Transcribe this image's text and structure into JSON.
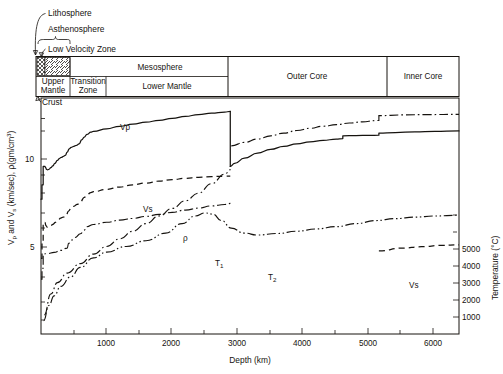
{
  "figure": {
    "title": "",
    "background_color": "#ffffff",
    "ink_color": "#16130f"
  },
  "annotations": {
    "lithosphere": "Lithosphere",
    "asthenosphere": "Asthenosphere",
    "low_velocity_zone": "Low Velocity Zone",
    "crust": "Crust"
  },
  "layer_bar": {
    "upper_row": [
      {
        "label": "Mesosphere",
        "start_km": 700,
        "end_km": 2900
      }
    ],
    "lower_row": [
      {
        "label": "Upper\nMantle",
        "line1": "Upper",
        "line2": "Mantle",
        "start_km": 0,
        "end_km": 400
      },
      {
        "label": "Transition\nZone",
        "line1": "Transition",
        "line2": "Zone",
        "start_km": 400,
        "end_km": 700
      },
      {
        "label": "Lower Mantle",
        "line1": "Lower Mantle",
        "line2": "",
        "start_km": 700,
        "end_km": 2900
      }
    ],
    "full_height": [
      {
        "label": "Outer Core",
        "start_km": 2900,
        "end_km": 5150
      },
      {
        "label": "Inner Core",
        "start_km": 5150,
        "end_km": 6371
      }
    ],
    "hatched_zones": [
      {
        "name": "low-velocity-zone-crosshatch",
        "start_km": 20,
        "end_km": 110,
        "pattern": "crosshatch"
      },
      {
        "name": "asthenosphere-hatch",
        "start_km": 110,
        "end_km": 400,
        "pattern": "diagonal"
      }
    ]
  },
  "axes": {
    "x": {
      "label": "Depth (km)",
      "min": 0,
      "max": 6371,
      "ticks": [
        1000,
        2000,
        3000,
        4000,
        5000,
        6000
      ],
      "tick_labels": [
        "1000",
        "2000",
        "3000",
        "4000",
        "5000",
        "6000"
      ],
      "minor_ticks": [
        500,
        1500,
        2500,
        3500,
        4500,
        5500
      ]
    },
    "y_left": {
      "label": "V_p and V_s (km/sec), ρ (gm/cm³)",
      "label_parts": [
        "V",
        "p",
        " and V",
        "s",
        " (km/sec),  ρ(gm/cm",
        "3",
        ")"
      ],
      "scale": "log",
      "min": 1.5,
      "max": 16,
      "ticks": [
        5,
        10
      ],
      "tick_labels": [
        "5",
        "10"
      ],
      "minor_ticks": [
        2,
        3,
        4,
        6,
        7,
        8,
        9,
        15
      ]
    },
    "y_right": {
      "label": "Temperature (°C)",
      "min": 0,
      "max": 6200,
      "ticks": [
        1000,
        2000,
        3000,
        4000,
        5000
      ],
      "tick_labels": [
        "1000",
        "2000",
        "3000",
        "4000",
        "5000"
      ]
    }
  },
  "chart_data": {
    "type": "line",
    "xlabel": "Depth (km)",
    "ylabel": "Vp and Vs (km/sec), ρ (gm/cm3)",
    "ylabel_right": "Temperature (°C)",
    "xlim": [
      0,
      6371
    ],
    "ylim": [
      1.5,
      16
    ],
    "ylim_right": [
      0,
      6200
    ],
    "yscale": "log",
    "grid": false,
    "legend": "inline-labels",
    "series": [
      {
        "name": "Vp",
        "label": "Vp",
        "axis": "left",
        "style": "solid",
        "units": "km/sec",
        "label_pos": {
          "x_km": 1180,
          "y_val": 11.8
        },
        "points": [
          [
            0,
            5.8
          ],
          [
            15,
            5.8
          ],
          [
            15,
            6.7
          ],
          [
            33,
            6.7
          ],
          [
            33,
            8.05
          ],
          [
            60,
            8.05
          ],
          [
            70,
            7.95
          ],
          [
            85,
            7.82
          ],
          [
            100,
            7.78
          ],
          [
            120,
            7.82
          ],
          [
            150,
            7.95
          ],
          [
            180,
            8.1
          ],
          [
            210,
            8.3
          ],
          [
            250,
            8.55
          ],
          [
            280,
            8.72
          ],
          [
            310,
            8.82
          ],
          [
            340,
            8.9
          ],
          [
            370,
            9.0
          ],
          [
            400,
            9.3
          ],
          [
            430,
            9.6
          ],
          [
            460,
            9.75
          ],
          [
            500,
            9.85
          ],
          [
            540,
            9.95
          ],
          [
            580,
            10.1
          ],
          [
            620,
            10.5
          ],
          [
            660,
            10.8
          ],
          [
            700,
            11.1
          ],
          [
            760,
            11.35
          ],
          [
            800,
            11.45
          ],
          [
            1000,
            11.75
          ],
          [
            1200,
            12.05
          ],
          [
            1400,
            12.3
          ],
          [
            1600,
            12.55
          ],
          [
            1800,
            12.8
          ],
          [
            2000,
            13.05
          ],
          [
            2200,
            13.3
          ],
          [
            2400,
            13.55
          ],
          [
            2600,
            13.75
          ],
          [
            2800,
            13.9
          ],
          [
            2885,
            13.98
          ]
        ]
      },
      {
        "name": "Vp-outer-core",
        "label": "",
        "axis": "left",
        "style": "solid",
        "units": "km/sec",
        "points": [
          [
            2885,
            8.05
          ],
          [
            2950,
            8.3
          ],
          [
            3100,
            8.75
          ],
          [
            3300,
            9.2
          ],
          [
            3500,
            9.55
          ],
          [
            3700,
            9.85
          ],
          [
            3900,
            10.1
          ],
          [
            4100,
            10.3
          ],
          [
            4300,
            10.45
          ],
          [
            4500,
            10.6
          ],
          [
            4600,
            10.65
          ],
          [
            4600,
            10.95
          ],
          [
            4800,
            10.98
          ],
          [
            5000,
            11.0
          ],
          [
            5150,
            11.02
          ],
          [
            5150,
            11.25
          ],
          [
            5400,
            11.32
          ],
          [
            5700,
            11.4
          ],
          [
            6000,
            11.45
          ],
          [
            6371,
            11.5
          ]
        ]
      },
      {
        "name": "Vs",
        "label": "Vs",
        "axis": "left",
        "style": "dashed",
        "units": "km/sec",
        "label_pos": {
          "x_km": 1450,
          "y_val": 5.7
        },
        "points": [
          [
            0,
            3.2
          ],
          [
            15,
            3.2
          ],
          [
            15,
            3.85
          ],
          [
            33,
            3.85
          ],
          [
            33,
            4.6
          ],
          [
            60,
            4.6
          ],
          [
            75,
            4.45
          ],
          [
            95,
            4.38
          ],
          [
            120,
            4.4
          ],
          [
            150,
            4.45
          ],
          [
            180,
            4.5
          ],
          [
            220,
            4.6
          ],
          [
            260,
            4.7
          ],
          [
            300,
            4.8
          ],
          [
            340,
            4.85
          ],
          [
            380,
            4.9
          ],
          [
            420,
            5.15
          ],
          [
            460,
            5.3
          ],
          [
            500,
            5.4
          ],
          [
            550,
            5.5
          ],
          [
            600,
            5.65
          ],
          [
            660,
            5.9
          ],
          [
            700,
            6.05
          ],
          [
            760,
            6.2
          ],
          [
            800,
            6.25
          ],
          [
            1000,
            6.4
          ],
          [
            1200,
            6.55
          ],
          [
            1400,
            6.7
          ],
          [
            1600,
            6.82
          ],
          [
            1800,
            6.95
          ],
          [
            2000,
            7.05
          ],
          [
            2200,
            7.15
          ],
          [
            2400,
            7.22
          ],
          [
            2600,
            7.28
          ],
          [
            2800,
            7.3
          ],
          [
            2885,
            7.3
          ]
        ]
      },
      {
        "name": "Vs-inner-core",
        "label": "Vs",
        "axis": "left",
        "style": "dashed",
        "units": "km/sec",
        "label_pos": {
          "x_km": 5500,
          "y_val": 3.75
        },
        "points": [
          [
            5150,
            3.45
          ],
          [
            5500,
            3.55
          ],
          [
            5800,
            3.6
          ],
          [
            6100,
            3.65
          ],
          [
            6371,
            3.67
          ]
        ]
      },
      {
        "name": "rho",
        "label": "ρ",
        "axis": "left",
        "style": "dash-dot",
        "units": "gm/cm3",
        "label_pos": {
          "x_km": 1850,
          "y_val": 5.45
        },
        "points": [
          [
            0,
            2.6
          ],
          [
            15,
            2.6
          ],
          [
            15,
            2.9
          ],
          [
            33,
            2.9
          ],
          [
            33,
            3.35
          ],
          [
            100,
            3.36
          ],
          [
            200,
            3.4
          ],
          [
            300,
            3.47
          ],
          [
            400,
            3.55
          ],
          [
            420,
            3.72
          ],
          [
            470,
            3.85
          ],
          [
            520,
            3.95
          ],
          [
            600,
            4.1
          ],
          [
            660,
            4.25
          ],
          [
            700,
            4.4
          ],
          [
            800,
            4.5
          ],
          [
            1000,
            4.6
          ],
          [
            1200,
            4.7
          ],
          [
            1400,
            4.78
          ],
          [
            1600,
            4.88
          ],
          [
            1800,
            4.98
          ],
          [
            2000,
            5.08
          ],
          [
            2200,
            5.2
          ],
          [
            2400,
            5.3
          ],
          [
            2600,
            5.42
          ],
          [
            2800,
            5.5
          ],
          [
            2900,
            5.56
          ]
        ]
      },
      {
        "name": "rho-core",
        "label": "",
        "axis": "left",
        "style": "dash-dot",
        "units": "gm/cm3",
        "points": [
          [
            2900,
            9.9
          ],
          [
            3100,
            10.25
          ],
          [
            3300,
            10.6
          ],
          [
            3500,
            10.95
          ],
          [
            3700,
            11.25
          ],
          [
            3900,
            11.55
          ],
          [
            4100,
            11.8
          ],
          [
            4300,
            12.05
          ],
          [
            4500,
            12.25
          ],
          [
            4700,
            12.45
          ],
          [
            4900,
            12.6
          ],
          [
            5100,
            12.75
          ],
          [
            5150,
            12.78
          ],
          [
            5150,
            13.4
          ],
          [
            5500,
            13.5
          ],
          [
            5900,
            13.55
          ],
          [
            6371,
            13.58
          ]
        ]
      },
      {
        "name": "T1",
        "label": "T1",
        "axis": "right",
        "style": "dash-dot",
        "units": "°C",
        "label_pos": {
          "x_km": 2600,
          "y_val": 4500
        },
        "points": [
          [
            50,
            500
          ],
          [
            150,
            1050
          ],
          [
            250,
            1350
          ],
          [
            400,
            1600
          ],
          [
            600,
            1850
          ],
          [
            800,
            2100
          ],
          [
            1000,
            2300
          ],
          [
            1200,
            2500
          ],
          [
            1400,
            2700
          ],
          [
            1600,
            2900
          ],
          [
            1800,
            3100
          ],
          [
            2000,
            3300
          ],
          [
            2200,
            3500
          ],
          [
            2400,
            3700
          ],
          [
            2600,
            3950
          ],
          [
            2800,
            4200
          ],
          [
            2890,
            4320
          ]
        ]
      },
      {
        "name": "T2",
        "label": "T2",
        "axis": "right",
        "style": "dash-dot-dot",
        "units": "°C",
        "label_pos": {
          "x_km": 3700,
          "y_val": 3500
        },
        "points": [
          [
            40,
            350
          ],
          [
            120,
            750
          ],
          [
            200,
            1000
          ],
          [
            300,
            1250
          ],
          [
            450,
            1500
          ],
          [
            600,
            1750
          ],
          [
            800,
            2000
          ],
          [
            1000,
            2150
          ],
          [
            1300,
            2300
          ],
          [
            1600,
            2450
          ],
          [
            1900,
            2650
          ],
          [
            2150,
            2900
          ],
          [
            2350,
            3100
          ],
          [
            2500,
            3180
          ],
          [
            2620,
            3150
          ],
          [
            2750,
            2980
          ],
          [
            2900,
            2780
          ],
          [
            3100,
            2650
          ],
          [
            3300,
            2600
          ],
          [
            3600,
            2640
          ],
          [
            3900,
            2700
          ],
          [
            4200,
            2760
          ],
          [
            4500,
            2820
          ],
          [
            4800,
            2900
          ],
          [
            5100,
            2980
          ],
          [
            5400,
            3030
          ],
          [
            5700,
            3070
          ],
          [
            6000,
            3100
          ],
          [
            6371,
            3120
          ]
        ]
      }
    ]
  }
}
